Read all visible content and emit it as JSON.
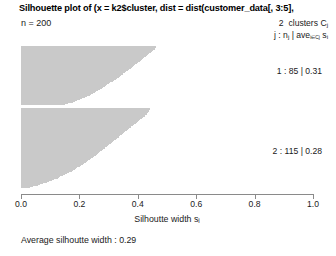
{
  "chart_data": {
    "type": "bar",
    "orientation": "horizontal",
    "title": "Silhouette plot of (x = k2$cluster, dist = dist(customer_data[, 3:5],",
    "n_label": "n = 200",
    "n": 200,
    "xlabel": "Silhoutte width s",
    "xlabel_sub": "i",
    "xlim": [
      0.0,
      1.0
    ],
    "xticks": [
      0.0,
      0.2,
      0.4,
      0.6,
      0.8,
      1.0
    ],
    "xtick_labels": [
      "0.0",
      "0.2",
      "0.4",
      "0.6",
      "0.8",
      "1.0"
    ],
    "grid": false,
    "legend_position": "top-right",
    "legend": {
      "clusters_count": "2",
      "clusters_text": "clusters C",
      "clusters_sub": "j",
      "formula_prefix": "j : n",
      "formula_prefix_sub": "j",
      "formula_mid": " | ave",
      "formula_mid_sub": "i∈Cj",
      "formula_suffix": " s",
      "formula_suffix_sub": "i"
    },
    "average_silhouette_label": "Average silhoutte width : 0.29",
    "average_silhouette_width": 0.29,
    "bar_color": "#c9c9c9",
    "axis_color": "#8a8a8a",
    "clusters": [
      {
        "id": 1,
        "label": "1 : 85 | 0.31",
        "size": 85,
        "avg_silhouette": 0.31,
        "label_y": 66,
        "top": 46,
        "bottom": 105,
        "values": [
          0.462,
          0.461,
          0.46,
          0.459,
          0.458,
          0.456,
          0.452,
          0.448,
          0.444,
          0.441,
          0.438,
          0.436,
          0.434,
          0.431,
          0.428,
          0.425,
          0.422,
          0.419,
          0.416,
          0.413,
          0.41,
          0.407,
          0.404,
          0.4,
          0.397,
          0.394,
          0.391,
          0.388,
          0.385,
          0.382,
          0.379,
          0.376,
          0.373,
          0.37,
          0.366,
          0.363,
          0.36,
          0.357,
          0.354,
          0.351,
          0.348,
          0.345,
          0.342,
          0.338,
          0.335,
          0.331,
          0.328,
          0.324,
          0.321,
          0.317,
          0.314,
          0.31,
          0.306,
          0.303,
          0.299,
          0.296,
          0.292,
          0.288,
          0.285,
          0.281,
          0.277,
          0.273,
          0.269,
          0.265,
          0.261,
          0.257,
          0.253,
          0.248,
          0.244,
          0.24,
          0.235,
          0.23,
          0.225,
          0.22,
          0.214,
          0.209,
          0.203,
          0.197,
          0.191,
          0.184,
          0.177,
          0.169,
          0.16,
          0.15,
          0.138
        ]
      },
      {
        "id": 2,
        "label": "2 : 115 | 0.28",
        "size": 115,
        "avg_silhouette": 0.28,
        "label_y": 146,
        "top": 108,
        "bottom": 188,
        "values": [
          0.443,
          0.442,
          0.441,
          0.44,
          0.439,
          0.437,
          0.435,
          0.433,
          0.431,
          0.428,
          0.426,
          0.423,
          0.42,
          0.417,
          0.414,
          0.411,
          0.408,
          0.405,
          0.402,
          0.399,
          0.396,
          0.393,
          0.39,
          0.387,
          0.384,
          0.381,
          0.378,
          0.375,
          0.372,
          0.369,
          0.366,
          0.363,
          0.36,
          0.357,
          0.354,
          0.351,
          0.348,
          0.345,
          0.342,
          0.34,
          0.337,
          0.334,
          0.331,
          0.328,
          0.325,
          0.322,
          0.319,
          0.316,
          0.313,
          0.31,
          0.307,
          0.304,
          0.301,
          0.298,
          0.295,
          0.292,
          0.289,
          0.286,
          0.283,
          0.28,
          0.277,
          0.274,
          0.271,
          0.268,
          0.265,
          0.262,
          0.259,
          0.256,
          0.252,
          0.249,
          0.246,
          0.243,
          0.24,
          0.236,
          0.233,
          0.23,
          0.226,
          0.223,
          0.219,
          0.216,
          0.212,
          0.208,
          0.205,
          0.201,
          0.197,
          0.193,
          0.189,
          0.185,
          0.181,
          0.177,
          0.173,
          0.168,
          0.164,
          0.159,
          0.155,
          0.15,
          0.145,
          0.14,
          0.135,
          0.13,
          0.125,
          0.119,
          0.113,
          0.107,
          0.101,
          0.095,
          0.088,
          0.081,
          0.074,
          0.066,
          0.058,
          0.049,
          0.04,
          0.03,
          0.018
        ]
      }
    ]
  }
}
